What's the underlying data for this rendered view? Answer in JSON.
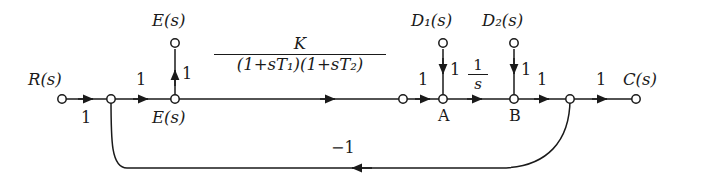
{
  "diagram": {
    "stroke_color": "#1a1a1a",
    "background_color": "#ffffff",
    "nodes": [
      {
        "id": "input",
        "label": "R(s)",
        "x": 62,
        "y": 99,
        "label_pos": "above"
      },
      {
        "id": "summing",
        "label": "",
        "x": 111,
        "y": 99,
        "label_pos": "none"
      },
      {
        "id": "error",
        "label": "E(s)",
        "x": 175,
        "y": 99,
        "label_pos": "below"
      },
      {
        "id": "error_out",
        "label": "E(s)",
        "x": 175,
        "y": 43,
        "label_pos": "above"
      },
      {
        "id": "plantout",
        "label": "",
        "x": 403,
        "y": 99,
        "label_pos": "none"
      },
      {
        "id": "A",
        "label": "A",
        "x": 443,
        "y": 99,
        "label_pos": "below"
      },
      {
        "id": "B",
        "label": "B",
        "x": 514,
        "y": 99,
        "label_pos": "below"
      },
      {
        "id": "takeoff",
        "label": "",
        "x": 570,
        "y": 99,
        "label_pos": "none"
      },
      {
        "id": "output",
        "label": "C(s)",
        "x": 636,
        "y": 99,
        "label_pos": "above"
      },
      {
        "id": "d1",
        "label": "D₁(s)",
        "x": 443,
        "y": 43,
        "label_pos": "above"
      },
      {
        "id": "d2",
        "label": "D₂(s)",
        "x": 514,
        "y": 43,
        "label_pos": "above"
      }
    ],
    "branch_gains": {
      "input_to_summing": "1",
      "summing_to_error": "1",
      "error_to_error_out": "1",
      "error_to_plantout_num": "K",
      "error_to_plantout_den": "(1+sT₁)(1+sT₂)",
      "plantout_to_A": "1",
      "d1_to_A": "1",
      "A_to_B_num": "1",
      "A_to_B_den": "s",
      "d2_to_B": "1",
      "B_to_takeoff": "1",
      "takeoff_to_output": "1",
      "feedback": "−1"
    },
    "signal_labels": {
      "reference": "R(s)",
      "error_top": "E(s)",
      "error_bottom": "E(s)",
      "disturbance_1": "D₁(s)",
      "disturbance_2": "D₂(s)",
      "output": "C(s)",
      "node_a": "A",
      "node_b": "B"
    },
    "transfer_function": {
      "numerator": "K",
      "denominator_factor_1": "(1+sT₁)",
      "denominator_factor_2": "(1+sT₂)"
    },
    "integrator": {
      "numerator": "1",
      "denominator": "s"
    },
    "feedback_gain": "−1"
  }
}
